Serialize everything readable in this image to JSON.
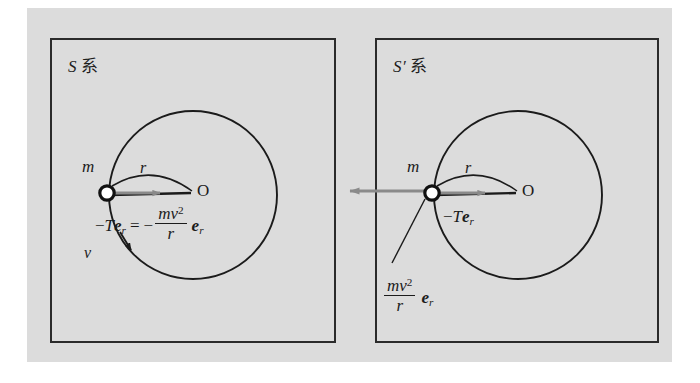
{
  "figure": {
    "background_color": "#dcdcdc",
    "page_color": "#ffffff",
    "ink_color": "#1b1b1b",
    "force_arrow_color": "#8a8a8a",
    "type": "physics-diagram"
  },
  "panels": [
    {
      "id": "S",
      "title_symbol": "S",
      "title_suffix": "系",
      "mass_label": "m",
      "origin_label": "O",
      "radius_label": "r",
      "velocity_label": "v",
      "equation": {
        "lhs_minus": "−",
        "lhs_T": "T",
        "lhs_e": "e",
        "lhs_sub": "r",
        "equals": "=",
        "rhs_minus": "−",
        "num_m": "m",
        "num_v": "v",
        "num_exp": "2",
        "den_r": "r",
        "rhs_e": "e",
        "rhs_sub": "r"
      }
    },
    {
      "id": "S'",
      "title_symbol": "S′",
      "title_suffix": "系",
      "mass_label": "m",
      "origin_label": "O",
      "radius_label": "r",
      "tension_label": {
        "minus": "−",
        "T": "T",
        "e": "e",
        "sub": "r"
      },
      "centrifugal_label": {
        "num_m": "m",
        "num_v": "v",
        "num_exp": "2",
        "den_r": "r",
        "e": "e",
        "sub": "r"
      }
    }
  ]
}
